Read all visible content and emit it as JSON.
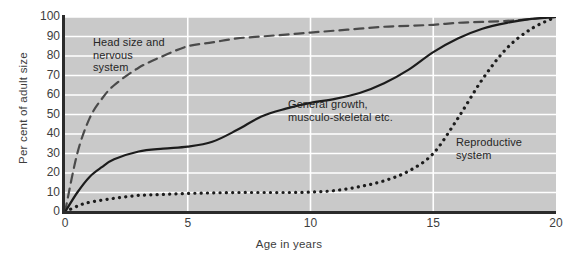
{
  "chart_data": {
    "type": "line",
    "title": "",
    "xlabel": "Age in years",
    "ylabel": "Per cent of adult size",
    "xlim": [
      0,
      20
    ],
    "ylim": [
      0,
      100
    ],
    "xticks": [
      0,
      5,
      10,
      15,
      20
    ],
    "yticks": [
      0,
      10,
      20,
      30,
      40,
      50,
      60,
      70,
      80,
      90,
      100
    ],
    "grid": "horizontal-and-vertical-white-gridlines",
    "legend": "inline-annotations",
    "plot_background": "#c9c9c9",
    "gridline_color": "#ffffff",
    "series": [
      {
        "name": "Head size and nervous system",
        "style": "dashed",
        "color": "#4a4a4a",
        "annotation": "Head size and\nnervous\nsystem",
        "x": [
          0,
          0.5,
          1,
          1.5,
          2,
          3,
          4,
          5,
          6,
          7,
          8,
          9,
          10,
          11,
          12,
          13,
          14,
          15,
          16,
          17,
          18,
          19,
          20
        ],
        "values": [
          0,
          30,
          48,
          58,
          65,
          74,
          80,
          85,
          87,
          89,
          90,
          91,
          92,
          93,
          94,
          95,
          95.5,
          96,
          97,
          97.5,
          98,
          99,
          100
        ]
      },
      {
        "name": "General growth, musculo-skeletal etc.",
        "style": "solid",
        "color": "#1c1c1c",
        "annotation": "General growth,\nmusculo-skeletal etc.",
        "x": [
          0,
          0.5,
          1,
          1.5,
          2,
          3,
          4,
          5,
          6,
          7,
          8,
          9,
          10,
          11,
          12,
          13,
          14,
          15,
          16,
          17,
          18,
          19,
          20
        ],
        "values": [
          0,
          10,
          18,
          23,
          27,
          31,
          32.5,
          33.5,
          36,
          42,
          49,
          53,
          56,
          58,
          61,
          66,
          73,
          82,
          89,
          94,
          97,
          99,
          100
        ]
      },
      {
        "name": "Reproductive system",
        "style": "dotted",
        "color": "#1c1c1c",
        "annotation": "Reproductive\nsystem",
        "x": [
          0,
          0.5,
          1,
          2,
          3,
          4,
          5,
          6,
          7,
          8,
          9,
          10,
          11,
          12,
          13,
          14,
          15,
          16,
          17,
          18,
          19,
          20
        ],
        "values": [
          0,
          3,
          5,
          7,
          8.5,
          9,
          9.5,
          9.8,
          10,
          10,
          10,
          10.2,
          11,
          13,
          16,
          21,
          30,
          48,
          68,
          84,
          94,
          100
        ]
      }
    ]
  },
  "axes": {
    "y_title": "Per cent of adult size",
    "x_title": "Age in years",
    "y_tick_labels": [
      "100",
      "90",
      "80",
      "70",
      "60",
      "50",
      "40",
      "30",
      "20",
      "10",
      "0"
    ],
    "x_tick_labels": [
      "0",
      "5",
      "10",
      "15",
      "20"
    ]
  },
  "annotations": {
    "neural": "Head size and\nnervous\nsystem",
    "general": "General growth,\nmusculo-skeletal etc.",
    "reproductive": "Reproductive\nsystem"
  }
}
